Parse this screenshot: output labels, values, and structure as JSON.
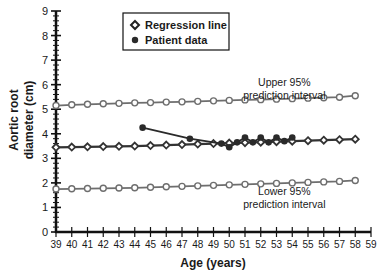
{
  "chart_data": {
    "type": "line",
    "title": "",
    "xlabel": "Age (years)",
    "ylabel": "Aortic root diameter (cm)",
    "ylabel_lines": [
      "Aortic root",
      "diameter (cm)"
    ],
    "xlim": [
      39,
      59
    ],
    "ylim": [
      0,
      9
    ],
    "x_ticks": [
      39,
      40,
      41,
      42,
      43,
      44,
      45,
      46,
      47,
      48,
      49,
      50,
      51,
      52,
      53,
      54,
      55,
      56,
      57,
      58,
      59
    ],
    "y_ticks": [
      0,
      1,
      2,
      3,
      4,
      5,
      6,
      7,
      8,
      9
    ],
    "grid": false,
    "legend": {
      "position": "upper-left-inside",
      "entries": [
        {
          "label": "Regression line",
          "marker": "diamond-open"
        },
        {
          "label": "Patient data",
          "marker": "circle-filled"
        }
      ]
    },
    "annotations": [
      {
        "text_lines": [
          "Upper 95%",
          "prediction interval"
        ],
        "x": 53.5,
        "y": 5.95
      },
      {
        "text_lines": [
          "Lower 95%",
          "prediction interval"
        ],
        "x": 53.5,
        "y": 1.5
      }
    ],
    "series": [
      {
        "name": "Upper 95% prediction interval",
        "marker": "circle-open",
        "x": [
          39,
          40,
          41,
          42,
          43,
          44,
          45,
          46,
          47,
          48,
          49,
          50,
          51,
          52,
          53,
          54,
          55,
          56,
          57,
          58
        ],
        "values": [
          5.15,
          5.18,
          5.2,
          5.22,
          5.24,
          5.26,
          5.27,
          5.29,
          5.3,
          5.32,
          5.34,
          5.36,
          5.38,
          5.39,
          5.41,
          5.43,
          5.45,
          5.47,
          5.49,
          5.55
        ]
      },
      {
        "name": "Regression line",
        "marker": "diamond-open",
        "x": [
          39,
          40,
          41,
          42,
          43,
          44,
          45,
          46,
          47,
          48,
          49,
          50,
          51,
          52,
          53,
          54,
          55,
          56,
          57,
          58
        ],
        "values": [
          3.45,
          3.46,
          3.47,
          3.48,
          3.49,
          3.5,
          3.52,
          3.54,
          3.56,
          3.58,
          3.6,
          3.62,
          3.64,
          3.66,
          3.68,
          3.7,
          3.72,
          3.74,
          3.76,
          3.78
        ]
      },
      {
        "name": "Lower 95% prediction interval",
        "marker": "circle-open",
        "x": [
          39,
          40,
          41,
          42,
          43,
          44,
          45,
          46,
          47,
          48,
          49,
          50,
          51,
          52,
          53,
          54,
          55,
          56,
          57,
          58
        ],
        "values": [
          1.75,
          1.76,
          1.77,
          1.78,
          1.79,
          1.8,
          1.82,
          1.84,
          1.86,
          1.88,
          1.9,
          1.92,
          1.94,
          1.96,
          1.98,
          2.0,
          2.02,
          2.04,
          2.06,
          2.1
        ]
      },
      {
        "name": "Patient data",
        "marker": "circle-filled",
        "x": [
          44.5,
          47.5,
          49.5,
          50.0,
          50.5,
          51.0,
          51.5,
          52.0,
          52.5,
          53.0,
          53.5,
          54.0
        ],
        "values": [
          4.25,
          3.8,
          3.6,
          3.45,
          3.65,
          3.85,
          3.65,
          3.85,
          3.65,
          3.85,
          3.7,
          3.85
        ]
      }
    ]
  },
  "colors": {
    "axis": "#111111",
    "interval_line": "#6e6e6e",
    "regression_line": "#333333",
    "patient": "#2a2a2a",
    "text": "#1a1a1a"
  }
}
